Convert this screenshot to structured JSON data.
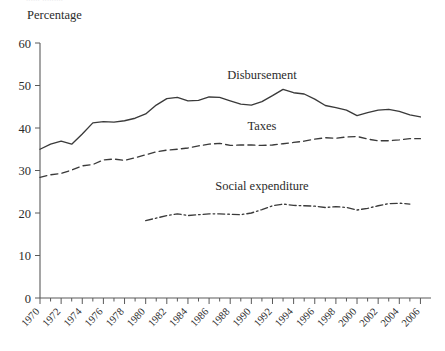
{
  "figure": {
    "clipped_caption": "...... .........",
    "y_axis_title": "Percentage"
  },
  "chart_data": {
    "type": "line",
    "title": "",
    "xlabel": "",
    "ylabel": "Percentage",
    "xlim": [
      1970,
      2007
    ],
    "ylim": [
      0,
      60
    ],
    "y_ticks": [
      0,
      10,
      20,
      30,
      40,
      50,
      60
    ],
    "x_ticks": [
      1970,
      1972,
      1974,
      1976,
      1978,
      1980,
      1982,
      1984,
      1986,
      1988,
      1990,
      1992,
      1994,
      1996,
      1998,
      2000,
      2002,
      2004,
      2006
    ],
    "x_minor_step": 1,
    "grid": false,
    "legend_position": "inline-annotations",
    "series": [
      {
        "name": "Disbursement",
        "style": "solid",
        "label_x": 1991,
        "label_y": 51.5,
        "x": [
          1970,
          1971,
          1972,
          1973,
          1974,
          1975,
          1976,
          1977,
          1978,
          1979,
          1980,
          1981,
          1982,
          1983,
          1984,
          1985,
          1986,
          1987,
          1988,
          1989,
          1990,
          1991,
          1992,
          1993,
          1994,
          1995,
          1996,
          1997,
          1998,
          1999,
          2000,
          2001,
          2002,
          2003,
          2004,
          2005,
          2006
        ],
        "values": [
          35.0,
          36.2,
          36.9,
          36.2,
          38.6,
          41.2,
          41.5,
          41.4,
          41.7,
          42.3,
          43.3,
          45.4,
          46.9,
          47.2,
          46.4,
          46.5,
          47.3,
          47.2,
          46.4,
          45.6,
          45.4,
          46.2,
          47.6,
          49.1,
          48.3,
          48.0,
          46.8,
          45.3,
          44.8,
          44.2,
          42.9,
          43.6,
          44.2,
          44.4,
          43.9,
          43.1,
          42.6
        ]
      },
      {
        "name": "Taxes",
        "style": "dashed",
        "label_x": 1991,
        "label_y": 39.6,
        "x": [
          1970,
          1971,
          1972,
          1973,
          1974,
          1975,
          1976,
          1977,
          1978,
          1979,
          1980,
          1981,
          1982,
          1983,
          1984,
          1985,
          1986,
          1987,
          1988,
          1989,
          1990,
          1991,
          1992,
          1993,
          1994,
          1995,
          1996,
          1997,
          1998,
          1999,
          2000,
          2001,
          2002,
          2003,
          2004,
          2005,
          2006
        ],
        "values": [
          28.4,
          29.0,
          29.3,
          30.1,
          31.1,
          31.4,
          32.5,
          32.7,
          32.4,
          33.0,
          33.7,
          34.4,
          34.8,
          35.0,
          35.3,
          35.8,
          36.2,
          36.4,
          35.9,
          36.0,
          36.0,
          35.9,
          36.0,
          36.3,
          36.6,
          36.9,
          37.4,
          37.7,
          37.6,
          37.9,
          38.0,
          37.4,
          37.0,
          37.0,
          37.2,
          37.5,
          37.5
        ]
      },
      {
        "name": "Social expenditure",
        "style": "dash-dot",
        "label_x": 1991,
        "label_y": 25.4,
        "x": [
          1980,
          1981,
          1982,
          1983,
          1984,
          1985,
          1986,
          1987,
          1988,
          1989,
          1990,
          1991,
          1992,
          1993,
          1994,
          1995,
          1996,
          1997,
          1998,
          1999,
          2000,
          2001,
          2002,
          2003,
          2004,
          2005
        ],
        "values": [
          18.2,
          18.8,
          19.4,
          19.8,
          19.4,
          19.6,
          19.8,
          19.8,
          19.7,
          19.6,
          20.0,
          20.8,
          21.7,
          22.1,
          21.8,
          21.7,
          21.6,
          21.3,
          21.5,
          21.3,
          20.7,
          21.1,
          21.7,
          22.2,
          22.3,
          22.1
        ]
      }
    ]
  }
}
